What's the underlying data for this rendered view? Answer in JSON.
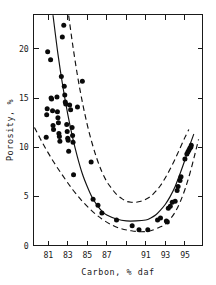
{
  "figure": {
    "background_color": "#ffffff",
    "ink_color": "#111111"
  },
  "chart_data": {
    "type": "scatter",
    "title": "",
    "subtitle": "",
    "xlabel": "Carbon, % daf",
    "ylabel": "Porosity, %",
    "xlim": [
      79.5,
      96.8
    ],
    "ylim": [
      0,
      23.5
    ],
    "grid": false,
    "legend": null,
    "legend_position": "none",
    "xticks": [
      81,
      83,
      85,
      87,
      89,
      91,
      93,
      95
    ],
    "xticklabels": [
      "81",
      "83",
      "85",
      "87",
      "",
      "91",
      "93",
      "95"
    ],
    "yticks": [
      0,
      5,
      10,
      15,
      20
    ],
    "yticklabels": [
      "0",
      "5",
      "10",
      "15",
      "20"
    ],
    "marker": "filled-circle",
    "marker_color": "#0a0a0a",
    "marker_size": 2.5,
    "points": [
      [
        80.95,
        19.7
      ],
      [
        80.9,
        13.9
      ],
      [
        80.85,
        13.3
      ],
      [
        80.8,
        11.0
      ],
      [
        81.25,
        18.9
      ],
      [
        81.3,
        15.0
      ],
      [
        81.35,
        14.9
      ],
      [
        81.45,
        13.7
      ],
      [
        81.5,
        12.2
      ],
      [
        81.55,
        11.8
      ],
      [
        81.9,
        15.1
      ],
      [
        81.95,
        13.6
      ],
      [
        82.0,
        13.0
      ],
      [
        82.05,
        12.5
      ],
      [
        82.1,
        11.4
      ],
      [
        82.15,
        11.1
      ],
      [
        82.2,
        10.6
      ],
      [
        82.35,
        17.2
      ],
      [
        82.45,
        21.2
      ],
      [
        82.6,
        22.4
      ],
      [
        82.65,
        16.2
      ],
      [
        82.7,
        15.3
      ],
      [
        82.75,
        14.6
      ],
      [
        82.8,
        14.4
      ],
      [
        82.9,
        12.3
      ],
      [
        82.95,
        11.6
      ],
      [
        83.0,
        10.9
      ],
      [
        83.05,
        10.7
      ],
      [
        83.1,
        9.6
      ],
      [
        83.2,
        14.3
      ],
      [
        83.3,
        13.8
      ],
      [
        83.45,
        12.0
      ],
      [
        83.5,
        11.2
      ],
      [
        83.55,
        10.5
      ],
      [
        83.6,
        7.2
      ],
      [
        84.0,
        14.1
      ],
      [
        84.5,
        16.7
      ],
      [
        85.4,
        8.5
      ],
      [
        85.6,
        4.7
      ],
      [
        86.1,
        4.1
      ],
      [
        86.5,
        3.3
      ],
      [
        88.0,
        2.6
      ],
      [
        89.6,
        2.0
      ],
      [
        90.3,
        1.6
      ],
      [
        91.2,
        1.6
      ],
      [
        92.2,
        2.6
      ],
      [
        92.5,
        2.8
      ],
      [
        93.1,
        2.5
      ],
      [
        93.2,
        2.4
      ],
      [
        93.3,
        3.8
      ],
      [
        93.5,
        4.0
      ],
      [
        93.7,
        4.4
      ],
      [
        94.0,
        4.5
      ],
      [
        94.2,
        5.6
      ],
      [
        94.3,
        6.0
      ],
      [
        94.5,
        6.6
      ],
      [
        94.6,
        7.0
      ],
      [
        95.0,
        8.8
      ],
      [
        95.2,
        9.3
      ],
      [
        95.3,
        9.5
      ],
      [
        95.4,
        9.7
      ],
      [
        95.5,
        9.9
      ],
      [
        95.6,
        10.0
      ],
      [
        95.65,
        10.2
      ]
    ],
    "curves": [
      {
        "name": "mean-trend",
        "style": "solid",
        "description": "Central best-fit U-shaped trend of porosity vs carbon content",
        "points": [
          [
            81.5,
            23.4
          ],
          [
            82.0,
            19.5
          ],
          [
            82.5,
            16.2
          ],
          [
            83.0,
            13.4
          ],
          [
            83.5,
            11.0
          ],
          [
            84.0,
            9.0
          ],
          [
            84.5,
            7.3
          ],
          [
            85.0,
            6.0
          ],
          [
            85.5,
            4.9
          ],
          [
            86.0,
            4.1
          ],
          [
            86.5,
            3.5
          ],
          [
            87.0,
            3.1
          ],
          [
            88.0,
            2.7
          ],
          [
            89.0,
            2.5
          ],
          [
            90.0,
            2.5
          ],
          [
            91.0,
            2.6
          ],
          [
            91.5,
            2.8
          ],
          [
            92.0,
            3.1
          ],
          [
            92.5,
            3.6
          ],
          [
            93.0,
            4.2
          ],
          [
            93.5,
            5.0
          ],
          [
            94.0,
            6.0
          ],
          [
            94.5,
            7.3
          ],
          [
            95.0,
            8.7
          ],
          [
            95.5,
            10.2
          ],
          [
            95.9,
            11.3
          ]
        ]
      },
      {
        "name": "upper-bound",
        "style": "dashed",
        "description": "Upper confidence envelope",
        "points": [
          [
            83.1,
            23.4
          ],
          [
            83.5,
            20.5
          ],
          [
            84.0,
            17.3
          ],
          [
            84.5,
            14.6
          ],
          [
            85.0,
            12.3
          ],
          [
            85.5,
            10.4
          ],
          [
            86.0,
            8.8
          ],
          [
            86.5,
            7.5
          ],
          [
            87.0,
            6.5
          ],
          [
            87.5,
            5.8
          ],
          [
            88.0,
            5.2
          ],
          [
            88.5,
            4.8
          ],
          [
            89.0,
            4.5
          ],
          [
            89.5,
            4.4
          ],
          [
            90.0,
            4.4
          ],
          [
            90.5,
            4.5
          ],
          [
            91.0,
            4.7
          ],
          [
            91.5,
            5.0
          ],
          [
            92.0,
            5.5
          ],
          [
            92.5,
            6.1
          ],
          [
            93.0,
            6.9
          ],
          [
            93.5,
            7.8
          ],
          [
            94.0,
            8.8
          ],
          [
            94.5,
            9.9
          ],
          [
            95.0,
            11.0
          ],
          [
            95.4,
            11.8
          ]
        ]
      },
      {
        "name": "lower-bound",
        "style": "dashed",
        "description": "Lower confidence envelope",
        "points": [
          [
            79.6,
            12.0
          ],
          [
            80.5,
            10.3
          ],
          [
            81.5,
            8.6
          ],
          [
            82.5,
            7.1
          ],
          [
            83.5,
            5.7
          ],
          [
            84.5,
            4.5
          ],
          [
            85.5,
            3.5
          ],
          [
            86.5,
            2.7
          ],
          [
            87.5,
            2.1
          ],
          [
            88.5,
            1.7
          ],
          [
            89.5,
            1.5
          ],
          [
            90.5,
            1.4
          ],
          [
            91.5,
            1.5
          ],
          [
            92.5,
            1.9
          ],
          [
            93.0,
            2.2
          ],
          [
            93.5,
            2.7
          ],
          [
            94.0,
            3.4
          ],
          [
            94.5,
            4.4
          ],
          [
            95.0,
            5.7
          ],
          [
            95.5,
            7.3
          ],
          [
            96.0,
            9.2
          ],
          [
            96.4,
            10.8
          ]
        ]
      }
    ]
  }
}
